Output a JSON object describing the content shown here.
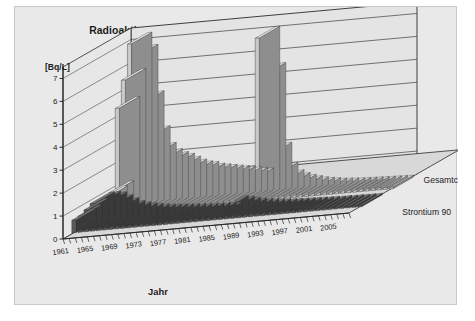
{
  "figure": {
    "title": "Radioaktive Stoffe in Milch – Jahresmittelwerte 1961–2008",
    "y_unit_label": "[Bq/L]",
    "x_axis_title": "Jahr",
    "series_label_back": "Gesamtcaesium",
    "series_label_front": "Strontium 90",
    "colors": {
      "panel_background": "#e9e9e9",
      "wall": "#e4e4e4",
      "floor": "#d8d8d8",
      "grid": "#4a4a4a",
      "axis": "#2b2b2b",
      "text": "#1b1b1b",
      "bar_back_face": "#c9c9c9",
      "bar_back_side": "#8e8e8e",
      "bar_back_top": "#e3e3e3",
      "bar_front_face": "#5a5a5a",
      "bar_front_side": "#3a3a3a",
      "bar_front_top": "#777777"
    }
  },
  "chart_data": {
    "type": "bar",
    "title": "Radioaktive Stoffe in Milch – Jahresmittelwerte 1961–2008",
    "xlabel": "Jahr",
    "ylabel": "[Bq/L]",
    "ylim": [
      0,
      7.5
    ],
    "yticks": [
      0,
      1,
      2,
      3,
      4,
      5,
      6,
      7
    ],
    "ytick_labels": [
      "0",
      "1",
      "2",
      "3",
      "4",
      "5",
      "6",
      "7"
    ],
    "grid": true,
    "legend": "series labels at right of floor",
    "projection": "3d-two-row",
    "x": [
      1961,
      1962,
      1963,
      1964,
      1965,
      1966,
      1967,
      1968,
      1969,
      1970,
      1971,
      1972,
      1973,
      1974,
      1975,
      1976,
      1977,
      1978,
      1979,
      1980,
      1981,
      1982,
      1983,
      1984,
      1985,
      1986,
      1987,
      1988,
      1989,
      1990,
      1991,
      1992,
      1993,
      1994,
      1995,
      1996,
      1997,
      1998,
      1999,
      2000,
      2001,
      2002,
      2003,
      2004,
      2005,
      2006,
      2007,
      2008
    ],
    "xtick_labels": [
      "1961",
      "1965",
      "1969",
      "1973",
      "1977",
      "1981",
      "1985",
      "1989",
      "1993",
      "1997",
      "2001",
      "2005"
    ],
    "xtick_years": [
      1961,
      1965,
      1969,
      1973,
      1977,
      1981,
      1985,
      1989,
      1993,
      1997,
      2001,
      2005
    ],
    "series": [
      {
        "name": "Gesamtcaesium",
        "row": "back",
        "values": [
          0.75,
          0.95,
          4.6,
          5.8,
          7.35,
          6.8,
          4.75,
          3.2,
          2.45,
          2.15,
          2.0,
          1.9,
          1.75,
          1.6,
          1.5,
          1.45,
          1.35,
          1.3,
          1.25,
          1.2,
          1.15,
          1.1,
          1.05,
          1.0,
          0.95,
          7.1,
          5.5,
          2.0,
          1.1,
          0.75,
          0.6,
          0.5,
          0.42,
          0.35,
          0.3,
          0.26,
          0.22,
          0.2,
          0.18,
          0.16,
          0.15,
          0.14,
          0.13,
          0.12,
          0.11,
          0.1,
          0.09,
          0.08
        ]
      },
      {
        "name": "Strontium 90",
        "row": "front",
        "values": [
          0.55,
          0.7,
          0.95,
          1.2,
          1.2,
          1.15,
          1.0,
          0.85,
          0.7,
          0.62,
          0.55,
          0.5,
          0.45,
          0.42,
          0.4,
          0.38,
          0.36,
          0.34,
          0.32,
          0.3,
          0.29,
          0.28,
          0.27,
          0.26,
          0.25,
          0.5,
          0.45,
          0.38,
          0.32,
          0.28,
          0.25,
          0.22,
          0.2,
          0.18,
          0.17,
          0.16,
          0.15,
          0.14,
          0.13,
          0.12,
          0.11,
          0.1,
          0.1,
          0.09,
          0.09,
          0.08,
          0.08,
          0.07
        ]
      }
    ],
    "annotations": [
      "1963–1965 Maximum durch oberirdische Kernwaffenversuche",
      "1986 Maximum durch Reaktorunfall Tschernobyl"
    ]
  }
}
